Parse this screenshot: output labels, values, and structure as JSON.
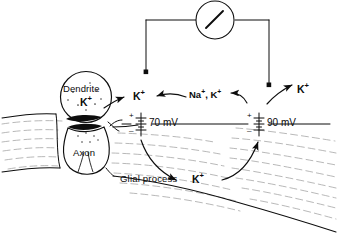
{
  "figure": {
    "domain": "biology-diagram",
    "ink_color": "#0d0d0d",
    "background_color": "#ffffff",
    "tissue_hatch_color": "#8d8d8d",
    "width": 338,
    "height": 241
  },
  "instrument": {
    "name": "galvanometer",
    "meter_label": "",
    "needle_angle_deg": -52,
    "left_electrode_label": "",
    "right_electrode_label": ""
  },
  "cells": {
    "dendrite": {
      "label": "Dendrite",
      "ion_label": "K",
      "ion_charge": "+"
    },
    "axon": {
      "label": "Axon"
    },
    "glia": {
      "label": "Glial process"
    }
  },
  "potentials": [
    {
      "id": "left-membrane-potential",
      "value": "70",
      "unit": "mV",
      "plus_sign": "+",
      "minus_sign": "–"
    },
    {
      "id": "right-membrane-potential",
      "value": "90",
      "unit": "mV",
      "plus_sign": "+",
      "minus_sign": "–"
    }
  ],
  "ion_labels": [
    {
      "id": "k-released-synapse",
      "text": "K",
      "charge": "+"
    },
    {
      "id": "na-k-extracellular",
      "text": "Na",
      "charge": "+",
      "text2": "K",
      "charge2": "+",
      "separator": ", "
    },
    {
      "id": "k-efflux-right",
      "text": "K",
      "charge": "+"
    },
    {
      "id": "k-glial-current",
      "text": "K",
      "charge": "+"
    }
  ]
}
